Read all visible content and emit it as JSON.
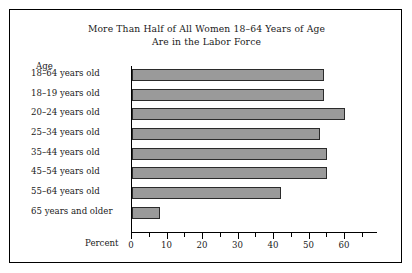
{
  "figure": {
    "title_line1": "More Than Half of All Women 18–64 Years of Age",
    "title_line2": "Are in the Labor Force",
    "category_axis_header": "Age",
    "value_axis_label": "Percent",
    "bar_fill_color": "#9a9a9a",
    "bar_border_color": "#2b2b2b",
    "frame_color": "#000000",
    "background_color": "#ffffff"
  },
  "chart_data": {
    "type": "bar",
    "orientation": "horizontal",
    "title": "More Than Half of All Women 18–64 Years of Age Are in the Labor Force",
    "xlabel": "Percent",
    "ylabel": "Age",
    "categories": [
      "18–64 years old",
      "18–19 years old",
      "20–24 years old",
      "25–34 years old",
      "35–44 years old",
      "45–54 years old",
      "55–64 years old",
      "65 years and older"
    ],
    "values": [
      54,
      54,
      60,
      53,
      55,
      55,
      42,
      8
    ],
    "xlim": [
      0,
      67
    ],
    "xticks_major": [
      0,
      10,
      20,
      30,
      40,
      50,
      60
    ],
    "xtick_labels": [
      "0",
      "10",
      "20",
      "30",
      "40",
      "50",
      "60"
    ],
    "xticks_minor": [
      5,
      15,
      25,
      35,
      45,
      55,
      65
    ],
    "grid": false,
    "legend": null,
    "series": [
      {
        "name": "Percent in labor force",
        "values": [
          54,
          54,
          60,
          53,
          55,
          55,
          42,
          8
        ]
      }
    ]
  }
}
